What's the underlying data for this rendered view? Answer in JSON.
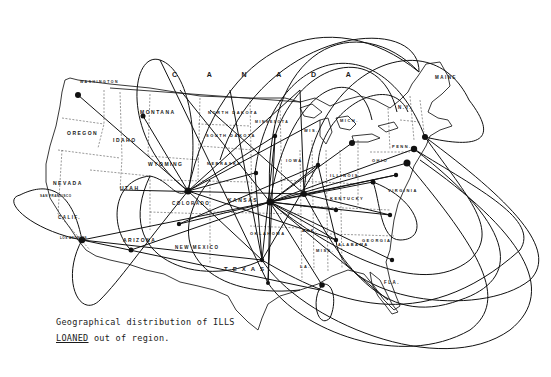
{
  "figure": {
    "caption_line1": "Geographical distribution of ILLS",
    "caption_line2_underlined": "LOANED",
    "caption_line2_rest": " out of region."
  },
  "map": {
    "country_label": "C A N A D A",
    "region_labels": [
      {
        "id": "washington",
        "text": "WASHINGTON",
        "x": 80,
        "y": 82,
        "size": 3.5
      },
      {
        "id": "oregon",
        "text": "OREGON",
        "x": 67,
        "y": 133,
        "size": 5
      },
      {
        "id": "idaho",
        "text": "IDAHO",
        "x": 113,
        "y": 140,
        "size": 5
      },
      {
        "id": "montana",
        "text": "MONTANA",
        "x": 140,
        "y": 112,
        "size": 5
      },
      {
        "id": "north-dakota",
        "text": "NORTH DAKOTA",
        "x": 208,
        "y": 112,
        "size": 4
      },
      {
        "id": "south-dakota",
        "text": "SOUTH DAKOTA",
        "x": 206,
        "y": 135,
        "size": 4
      },
      {
        "id": "minnesota",
        "text": "MINNESOTA",
        "x": 255,
        "y": 122,
        "size": 3.5
      },
      {
        "id": "wyoming",
        "text": "WYOMING",
        "x": 148,
        "y": 164,
        "size": 5
      },
      {
        "id": "nebraska",
        "text": "NEBRASKA",
        "x": 207,
        "y": 163,
        "size": 4
      },
      {
        "id": "nevada",
        "text": "NEVADA",
        "x": 53,
        "y": 183,
        "size": 5
      },
      {
        "id": "utah",
        "text": "UTAH",
        "x": 120,
        "y": 188,
        "size": 5
      },
      {
        "id": "colorado",
        "text": "COLORADO",
        "x": 172,
        "y": 203,
        "size": 4.5
      },
      {
        "id": "kansas",
        "text": "KANSAS",
        "x": 228,
        "y": 200,
        "size": 5
      },
      {
        "id": "california",
        "text": "CALIF.",
        "x": 58,
        "y": 218,
        "size": 4.5
      },
      {
        "id": "arizona",
        "text": "ARIZONA",
        "x": 123,
        "y": 240,
        "size": 5
      },
      {
        "id": "new-mexico",
        "text": "NEW MEXICO",
        "x": 175,
        "y": 248,
        "size": 4.5
      },
      {
        "id": "oklahoma",
        "text": "OKLAHOMA",
        "x": 250,
        "y": 233,
        "size": 4
      },
      {
        "id": "texas",
        "text": "TEXAS",
        "x": 224,
        "y": 270,
        "size": 6
      },
      {
        "id": "illinois",
        "text": "ILLINOIS",
        "x": 330,
        "y": 175,
        "size": 4
      },
      {
        "id": "ohio",
        "text": "OHIO",
        "x": 372,
        "y": 160,
        "size": 4
      },
      {
        "id": "penn",
        "text": "PENN.",
        "x": 392,
        "y": 146,
        "size": 4
      },
      {
        "id": "kentucky",
        "text": "KENTUCKY",
        "x": 330,
        "y": 198,
        "size": 4
      },
      {
        "id": "virginia",
        "text": "VIRGINIA",
        "x": 388,
        "y": 190,
        "size": 4
      },
      {
        "id": "alabama",
        "text": "ALABAMA",
        "x": 338,
        "y": 244,
        "size": 4
      },
      {
        "id": "georgia",
        "text": "GEORGIA",
        "x": 362,
        "y": 240,
        "size": 4
      },
      {
        "id": "maine",
        "text": "MAINE",
        "x": 435,
        "y": 78,
        "size": 4.5
      },
      {
        "id": "ny",
        "text": "N.Y.",
        "x": 398,
        "y": 108,
        "size": 4.5
      },
      {
        "id": "florida",
        "text": "FLA.",
        "x": 384,
        "y": 283,
        "size": 4.5
      },
      {
        "id": "arkansas",
        "text": "ARK.",
        "x": 302,
        "y": 230,
        "size": 4
      },
      {
        "id": "miss",
        "text": "MISS.",
        "x": 316,
        "y": 250,
        "size": 4
      },
      {
        "id": "la",
        "text": "LA.",
        "x": 300,
        "y": 266,
        "size": 4
      },
      {
        "id": "iowa",
        "text": "IOWA",
        "x": 286,
        "y": 160,
        "size": 4
      },
      {
        "id": "wisconsin",
        "text": "WIS.",
        "x": 304,
        "y": 130,
        "size": 4
      },
      {
        "id": "michigan",
        "text": "MICH.",
        "x": 340,
        "y": 120,
        "size": 4
      },
      {
        "id": "san-francisco",
        "text": "SAN FRANCISCO",
        "x": 40,
        "y": 196,
        "size": 3
      },
      {
        "id": "los-angeles",
        "text": "LOS ANGELES",
        "x": 60,
        "y": 238,
        "size": 3
      }
    ],
    "hubs": [
      {
        "id": "seattle",
        "x": 78,
        "y": 95
      },
      {
        "id": "helena",
        "x": 143,
        "y": 116
      },
      {
        "id": "los-angeles",
        "x": 82,
        "y": 240
      },
      {
        "id": "phoenix",
        "x": 131,
        "y": 250
      },
      {
        "id": "denver",
        "x": 188,
        "y": 191
      },
      {
        "id": "santa-fe",
        "x": 179,
        "y": 224
      },
      {
        "id": "kansas-city",
        "x": 270,
        "y": 202
      },
      {
        "id": "minneapolis",
        "x": 275,
        "y": 136
      },
      {
        "id": "omaha",
        "x": 256,
        "y": 173
      },
      {
        "id": "st-louis",
        "x": 304,
        "y": 194
      },
      {
        "id": "chicago",
        "x": 318,
        "y": 165
      },
      {
        "id": "detroit",
        "x": 352,
        "y": 143
      },
      {
        "id": "columbus",
        "x": 373,
        "y": 182
      },
      {
        "id": "pittsburgh",
        "x": 390,
        "y": 155
      },
      {
        "id": "philadelphia",
        "x": 414,
        "y": 149
      },
      {
        "id": "new-york",
        "x": 425,
        "y": 137
      },
      {
        "id": "washington-dc",
        "x": 407,
        "y": 163
      },
      {
        "id": "richmond",
        "x": 396,
        "y": 175
      },
      {
        "id": "atlanta",
        "x": 336,
        "y": 240
      },
      {
        "id": "new-orleans",
        "x": 322,
        "y": 285
      },
      {
        "id": "dallas",
        "x": 262,
        "y": 260
      },
      {
        "id": "houston",
        "x": 268,
        "y": 283
      },
      {
        "id": "raleigh",
        "x": 390,
        "y": 215
      },
      {
        "id": "charleston",
        "x": 392,
        "y": 260
      },
      {
        "id": "nashville",
        "x": 336,
        "y": 210
      },
      {
        "id": "tampa",
        "x": 388,
        "y": 300
      },
      {
        "id": "boston-ne",
        "x": 419,
        "y": 72
      }
    ],
    "flow_lines_description": "Loan flow arcs radiating from Kansas/Denver region hubs to all regions; large ellipses over Atlantic and Gulf"
  }
}
